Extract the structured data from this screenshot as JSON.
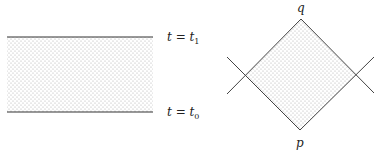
{
  "figures": {
    "left": {
      "top_label": {
        "var": "t",
        "eq": " = ",
        "val": "t",
        "sub": "1"
      },
      "bottom_label": {
        "var": "t",
        "eq": " = ",
        "val": "t",
        "sub": "0"
      }
    },
    "right": {
      "top_vertex_label": "q",
      "bottom_vertex_label": "p"
    }
  },
  "colors": {
    "line": "#333333",
    "dots": "#9a9a9a",
    "background": "#ffffff"
  }
}
